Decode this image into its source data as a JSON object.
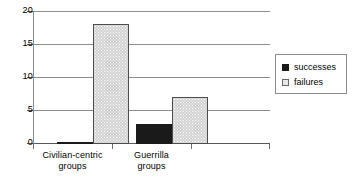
{
  "chart_data": {
    "type": "bar",
    "title": "",
    "subtitle": "",
    "xlabel": "",
    "ylabel": "",
    "categories": [
      "Civilian-centric groups",
      "Guerrilla groups"
    ],
    "category_lines": [
      [
        "Civilian-centric",
        "groups"
      ],
      [
        "Guerrilla",
        "groups"
      ]
    ],
    "series": [
      {
        "name": "successes",
        "values": [
          0,
          3
        ],
        "color": "#1a1a1a"
      },
      {
        "name": "failures",
        "values": [
          18,
          7
        ],
        "color": "#d2d2d2"
      }
    ],
    "ylim": [
      0,
      20
    ],
    "yticks": [
      0,
      5,
      10,
      15,
      20
    ],
    "ytick_labels": [
      "0",
      "5",
      "10",
      "15",
      "20"
    ],
    "grid": true,
    "grid_axis": "y",
    "legend_position": "right",
    "legend_entries": [
      "successes",
      "failures"
    ]
  },
  "legend": {
    "items": [
      {
        "label": "successes"
      },
      {
        "label": "failures"
      }
    ]
  },
  "axis": {
    "y_tick_labels": [
      "20",
      "15",
      "10",
      "5",
      "0"
    ]
  }
}
